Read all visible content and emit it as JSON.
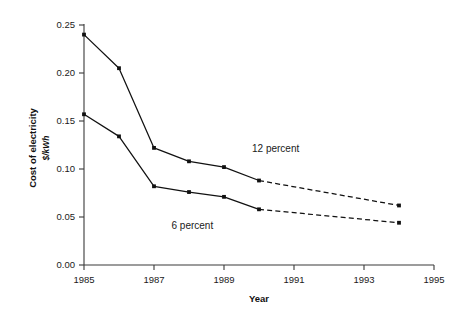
{
  "chart_data": {
    "type": "line",
    "title": "",
    "xlabel": "Year",
    "ylabel": "Cost of electricity",
    "ylabel_units": "$/kWh",
    "xlim": [
      1985,
      1995
    ],
    "ylim": [
      0.0,
      0.25
    ],
    "xticks": [
      1985,
      1987,
      1989,
      1991,
      1993,
      1995
    ],
    "xtick_labels": [
      "1985",
      "1987",
      "1989",
      "1991",
      "1993",
      "1995"
    ],
    "yticks": [
      0.0,
      0.05,
      0.1,
      0.15,
      0.2,
      0.25
    ],
    "ytick_labels": [
      "0.00",
      "0.05",
      "0.10",
      "0.15",
      "0.20",
      "0.25"
    ],
    "grid": false,
    "legend": "inline-annotations",
    "line_color": "#111111",
    "axis_color": "#3a3a3a",
    "background": "#ffffff",
    "x": [
      1985,
      1986,
      1987,
      1988,
      1989,
      1990,
      1994
    ],
    "series": [
      {
        "name": "12 percent",
        "label": "12 percent",
        "label_x": 1989.8,
        "label_y": 0.118,
        "values": [
          0.24,
          0.205,
          0.122,
          0.108,
          0.102,
          0.088,
          0.062
        ],
        "solid_through": 1990,
        "dashed_from": 1990,
        "style": "solid-then-dashed",
        "marker": "square"
      },
      {
        "name": "6 percent",
        "label": "6 percent",
        "label_x": 1987.5,
        "label_y": 0.038,
        "values": [
          0.157,
          0.134,
          0.082,
          0.076,
          0.071,
          0.058,
          0.044
        ],
        "solid_through": 1990,
        "dashed_from": 1990,
        "style": "solid-then-dashed",
        "marker": "square"
      }
    ]
  },
  "figure": {
    "caption": ""
  }
}
